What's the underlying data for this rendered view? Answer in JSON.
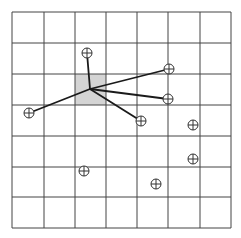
{
  "diagram": {
    "type": "grid-nearest-neighbor-star",
    "grid": {
      "cols": 7,
      "rows": 7,
      "x_lines": [
        12,
        44,
        75,
        106,
        137,
        168,
        200,
        231
      ],
      "y_lines": [
        12,
        43,
        74,
        105,
        136,
        167,
        197,
        228
      ],
      "line_color": "#444444",
      "background": "#ffffff"
    },
    "highlighted_cell": {
      "col": 2,
      "row": 2,
      "x": 75,
      "y": 74,
      "w": 31,
      "h": 31,
      "fill": "#d4d4d4"
    },
    "hub": {
      "x": 90,
      "y": 89
    },
    "points": [
      {
        "id": "p1",
        "x": 87,
        "y": 53,
        "connected": true
      },
      {
        "id": "p2",
        "x": 29,
        "y": 113,
        "connected": true
      },
      {
        "id": "p3",
        "x": 169,
        "y": 69,
        "connected": true
      },
      {
        "id": "p4",
        "x": 168,
        "y": 99,
        "connected": true
      },
      {
        "id": "p5",
        "x": 141,
        "y": 121,
        "connected": true
      },
      {
        "id": "p6",
        "x": 193,
        "y": 125,
        "connected": false
      },
      {
        "id": "p7",
        "x": 193,
        "y": 159,
        "connected": false
      },
      {
        "id": "p8",
        "x": 84,
        "y": 171,
        "connected": false
      },
      {
        "id": "p9",
        "x": 156,
        "y": 184,
        "connected": false
      }
    ],
    "marker": {
      "symbol": "circle-plus",
      "radius": 5,
      "stroke": "#333333"
    },
    "edge_color": "#1a1a1a"
  }
}
